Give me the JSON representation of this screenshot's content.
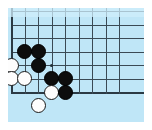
{
  "diagram": {
    "type": "go-board-position",
    "board": {
      "background_color": "#bfe6f7",
      "line_color": "#3a4a55",
      "edge_color": "#2b3a44",
      "page_background": "#ffffff",
      "columns": 9,
      "rows": 7,
      "cell_size": 13.5,
      "origin_x": 11,
      "origin_y": 11,
      "left_edge_is_board_edge": true,
      "bottom_edge_is_board_edge": true,
      "top_edge_is_board_edge": false,
      "right_edge_is_board_edge": false,
      "lines_extend_above_top": true
    },
    "star_points": [
      {
        "col": 3,
        "row": 4
      }
    ],
    "stones": [
      {
        "color": "black",
        "col": 1,
        "row": 3
      },
      {
        "color": "black",
        "col": 2,
        "row": 3
      },
      {
        "color": "white",
        "col": 0,
        "row": 4
      },
      {
        "color": "black",
        "col": 2,
        "row": 4
      },
      {
        "color": "white",
        "col": 0,
        "row": 5
      },
      {
        "color": "white",
        "col": 1,
        "row": 5
      },
      {
        "color": "black",
        "col": 3,
        "row": 5
      },
      {
        "color": "black",
        "col": 4,
        "row": 5
      },
      {
        "color": "white",
        "col": 3,
        "row": 6
      },
      {
        "color": "black",
        "col": 4,
        "row": 6
      },
      {
        "color": "white",
        "col": 2,
        "row": 7
      }
    ],
    "stone_colors": {
      "black_fill": "#0d0d0d",
      "black_stroke": "#000000",
      "white_fill": "#fdfdfd",
      "white_stroke": "#1a1a1a"
    }
  }
}
